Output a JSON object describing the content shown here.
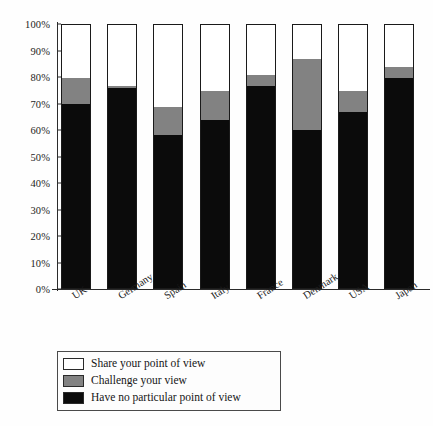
{
  "chart_data": {
    "type": "bar",
    "subtype": "stacked-bar-100-percent",
    "title": "",
    "xlabel": "",
    "ylabel": "",
    "ylim": [
      0,
      100
    ],
    "yticks": [
      "0%",
      "10%",
      "20%",
      "30%",
      "40%",
      "50%",
      "60%",
      "70%",
      "80%",
      "90%",
      "100%"
    ],
    "ytick_values": [
      0,
      10,
      20,
      30,
      40,
      50,
      60,
      70,
      80,
      90,
      100
    ],
    "grid": false,
    "legend_position": "bottom-left",
    "categories": [
      "UK",
      "Germany",
      "Spain",
      "Italy",
      "France",
      "Denmark",
      "USA",
      "Japan"
    ],
    "series": [
      {
        "name": "Have no particular point of view",
        "color": "#0b0b0b",
        "values": [
          70,
          76,
          58,
          64,
          77,
          60,
          67,
          80
        ]
      },
      {
        "name": "Challenge your view",
        "color": "#828282",
        "values": [
          10,
          1,
          11,
          11,
          4,
          27,
          8,
          4
        ]
      },
      {
        "name": "Share your point of view",
        "color": "#ffffff",
        "values": [
          20,
          23,
          31,
          25,
          19,
          13,
          25,
          16
        ]
      }
    ]
  },
  "legend": {
    "items": [
      {
        "label": "Share your point of view",
        "color": "#ffffff"
      },
      {
        "label": "Challenge your view",
        "color": "#828282"
      },
      {
        "label": "Have no particular point of view",
        "color": "#0b0b0b"
      }
    ]
  }
}
